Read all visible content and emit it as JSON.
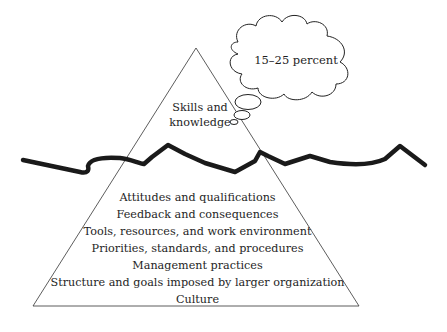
{
  "diagram": {
    "type": "iceberg",
    "above_water": {
      "label_line1": "Skills and",
      "label_line2": "knowledge"
    },
    "thought_bubble": {
      "text": "15–25 percent"
    },
    "below_water": {
      "items": [
        "Attitudes and qualifications",
        "Feedback and consequences",
        "Tools, resources, and work environment",
        "Priorities, standards, and procedures",
        "Management practices",
        "Structure and goals imposed by larger organization",
        "Culture"
      ]
    },
    "colors": {
      "line": "#1a1a1a",
      "text": "#1e1e1e",
      "background": "#ffffff"
    }
  }
}
